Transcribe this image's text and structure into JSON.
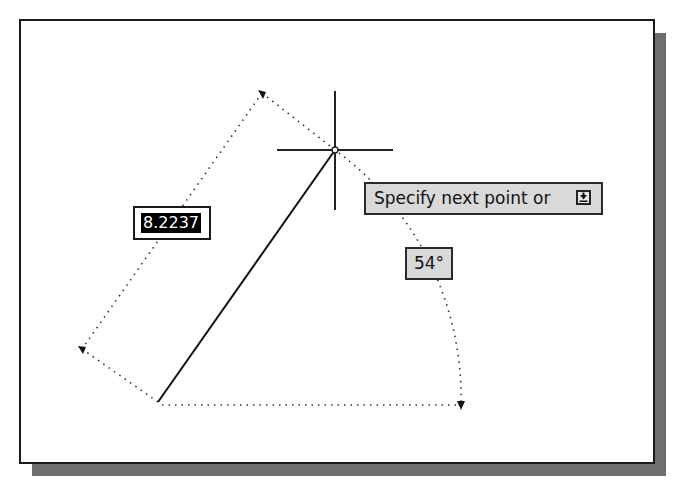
{
  "viewport": {
    "background": "#ffffff",
    "frame_border_color": "#1a1a1a",
    "shadow_color": "#6e6e6e"
  },
  "drawing": {
    "line": {
      "start": [
        158,
        402
      ],
      "end": [
        335,
        150
      ]
    },
    "crosshair": {
      "center": [
        335,
        150
      ],
      "horizontal": [
        277,
        393
      ],
      "vertical": [
        91,
        210
      ]
    },
    "length_dimension": {
      "arrow_top": [
        262,
        93
      ],
      "arrow_bottom": [
        82,
        349
      ]
    },
    "angle_dimension": {
      "arc_start": [
        339,
        153
      ],
      "arc_end": [
        461,
        405
      ],
      "baseline_end": [
        461,
        405
      ]
    }
  },
  "dynamic_input": {
    "length_value": "8.2237",
    "angle_value": "54°"
  },
  "tooltip": {
    "prompt": "Specify next point or",
    "options_icon": "down-arrow-icon"
  }
}
